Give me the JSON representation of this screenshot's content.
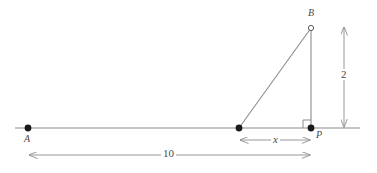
{
  "figure": {
    "type": "geometry-diagram",
    "background_color": "#ffffff",
    "stroke_color": "#8c8c8c",
    "text_color": "#4a4a4a"
  },
  "points": [
    {
      "id": "A",
      "label": "A",
      "marker": "filled-dot",
      "x": 28,
      "y": 128
    },
    {
      "id": "V",
      "label": "",
      "marker": "filled-dot",
      "x": 239,
      "y": 128
    },
    {
      "id": "P",
      "label": "P",
      "marker": "filled-dot",
      "x": 311,
      "y": 128
    },
    {
      "id": "B",
      "label": "B",
      "marker": "open-circle",
      "x": 311,
      "y": 28
    }
  ],
  "dimensions": [
    {
      "id": "x",
      "label": "x",
      "italic": true,
      "orientation": "horizontal",
      "from": 239,
      "to": 311,
      "axis_pos": 140
    },
    {
      "id": "ten",
      "label": "10",
      "italic": false,
      "orientation": "horizontal",
      "from": 28,
      "to": 311,
      "axis_pos": 155
    },
    {
      "id": "two",
      "label": "2",
      "italic": false,
      "orientation": "vertical",
      "from": 28,
      "to": 128,
      "axis_pos": 344
    }
  ],
  "baseline": {
    "x_start": 15,
    "x_end": 360,
    "y": 128
  },
  "right_angle": {
    "at": "P",
    "size": 8
  }
}
